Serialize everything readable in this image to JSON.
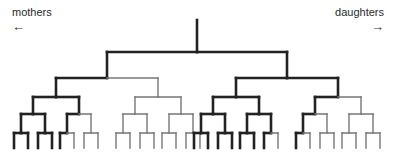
{
  "labels": {
    "left": "mothers",
    "left_arrow": "←",
    "right": "daughters",
    "right_arrow": "→"
  },
  "tree": {
    "type": "binary-pedigree-tree",
    "depth": 5,
    "leaf_count": 32,
    "root_x": 197,
    "level_y": [
      20,
      52,
      78,
      97,
      114,
      133,
      148
    ],
    "style": {
      "solid_color": "#222222",
      "dashed_color": "#777777",
      "solid_width": 2.6,
      "dashed_width": 1.4
    },
    "solid_paths": [
      "L",
      "LL",
      "LLL",
      "LLLL",
      "LLLLL",
      "LLLLR",
      "LLLR",
      "LLLRL",
      "LLLRR",
      "LLR",
      "LLRL",
      "LLRLL",
      "R",
      "RL",
      "RLL",
      "RLLL",
      "RLLLL",
      "RLLLR",
      "RLLR",
      "RLLRL",
      "RLLRR",
      "RLR",
      "RLRL",
      "RLRLL",
      "RLRLR",
      "RLRR",
      "RLRRL",
      "RR",
      "RRL",
      "RRLL",
      "RRLLL"
    ]
  }
}
